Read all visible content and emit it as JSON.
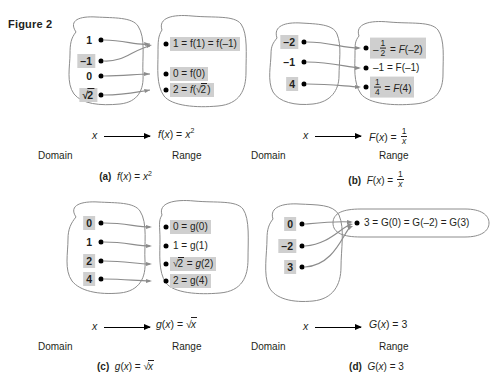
{
  "figure": {
    "label": "Figure 2"
  },
  "panels": [
    {
      "id": "a",
      "caption_letter": "(a)",
      "caption_formula": "f(x) = x²",
      "map_x": "x",
      "map_formula": "f(x) = x²",
      "domain_label": "Domain",
      "range_label": "Range",
      "domain_values": [
        "1",
        "√2̅ placeholder",
        "0",
        "√2"
      ],
      "domain": [
        {
          "text": "1",
          "highlight": false
        },
        {
          "text": "–1",
          "highlight": true
        },
        {
          "text": "0",
          "highlight": false
        },
        {
          "text": "√2",
          "highlight": true
        }
      ],
      "range": [
        {
          "text": "1 = f(1) = f(–1)",
          "highlight": true
        },
        {
          "text": "0 = f(0)",
          "highlight": true
        },
        {
          "text": "2 = f(√2)",
          "highlight": true
        }
      ],
      "arrows": [
        {
          "from": 0,
          "to": 0
        },
        {
          "from": 1,
          "to": 0
        },
        {
          "from": 2,
          "to": 1
        },
        {
          "from": 3,
          "to": 2
        }
      ]
    },
    {
      "id": "b",
      "caption_letter": "(b)",
      "caption_formula": "F(x) = 1/x",
      "map_x": "x",
      "map_formula": "F(x) = 1/x",
      "domain_label": "Domain",
      "range_label": "Range",
      "domain": [
        {
          "text": "–2",
          "highlight": true
        },
        {
          "text": "–1",
          "highlight": false
        },
        {
          "text": "4",
          "highlight": true
        }
      ],
      "range": [
        {
          "text": "–½ = F(–2)",
          "highlight": true
        },
        {
          "text": "–1 = F(–1)",
          "highlight": false
        },
        {
          "text": "¼ = F(4)",
          "highlight": true
        }
      ],
      "arrows": [
        {
          "from": 0,
          "to": 0
        },
        {
          "from": 1,
          "to": 1
        },
        {
          "from": 2,
          "to": 2
        }
      ]
    },
    {
      "id": "c",
      "caption_letter": "(c)",
      "caption_formula": "g(x) = √x",
      "map_x": "x",
      "map_formula": "g(x) = √x",
      "domain_label": "Domain",
      "range_label": "Range",
      "domain": [
        {
          "text": "0",
          "highlight": true
        },
        {
          "text": "1",
          "highlight": false
        },
        {
          "text": "2",
          "highlight": true
        },
        {
          "text": "4",
          "highlight": true
        }
      ],
      "range": [
        {
          "text": "0 = g(0)",
          "highlight": true
        },
        {
          "text": "1 = g(1)",
          "highlight": false
        },
        {
          "text": "√2 = g(2)",
          "highlight": true
        },
        {
          "text": "2 = g(4)",
          "highlight": true
        }
      ],
      "arrows": [
        {
          "from": 0,
          "to": 0
        },
        {
          "from": 1,
          "to": 1
        },
        {
          "from": 2,
          "to": 2
        },
        {
          "from": 3,
          "to": 3
        }
      ]
    },
    {
      "id": "d",
      "caption_letter": "(d)",
      "caption_formula": "G(x) = 3",
      "map_x": "x",
      "map_formula": "G(x) = 3",
      "domain_label": "Domain",
      "range_label": "Range",
      "domain": [
        {
          "text": "0",
          "highlight": true
        },
        {
          "text": "–2",
          "highlight": true
        },
        {
          "text": "3",
          "highlight": true
        }
      ],
      "range": [
        {
          "text": "3 = G(0) = G(–2) = G(3)",
          "highlight": false
        }
      ],
      "arrows": [
        {
          "from": 0,
          "to": 0
        },
        {
          "from": 1,
          "to": 0
        },
        {
          "from": 2,
          "to": 0
        }
      ]
    }
  ],
  "colors": {
    "highlight": "#cfcfcf",
    "outline": "#808080",
    "text": "#231f20",
    "arrow": "#808080"
  }
}
